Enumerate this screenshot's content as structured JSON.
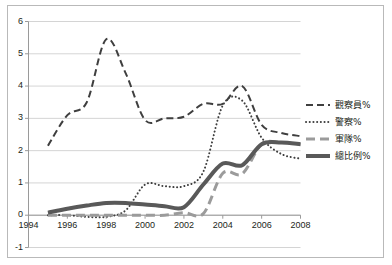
{
  "chart_data": {
    "type": "line",
    "title": "",
    "subtitle": "",
    "xlabel": "",
    "ylabel": "",
    "xlim": [
      1994,
      2008
    ],
    "ylim": [
      -1,
      6
    ],
    "yticks": [
      "6",
      "5",
      "4",
      "3",
      "2",
      "1",
      "0",
      "-1"
    ],
    "ytick_values": [
      6,
      5,
      4,
      3,
      2,
      1,
      0,
      -1
    ],
    "xticks": [
      "1994",
      "1996",
      "1998",
      "2000",
      "2002",
      "2004",
      "2006",
      "2008"
    ],
    "xtick_values": [
      1994,
      1996,
      1998,
      2000,
      2002,
      2004,
      2006,
      2008
    ],
    "grid": "horizontal",
    "legend_position": "right",
    "x": [
      1995,
      1996,
      1997,
      1998,
      1999,
      2000,
      2001,
      2002,
      2003,
      2004,
      2005,
      2006,
      2007,
      2008
    ],
    "series": [
      {
        "name": "觀察員%",
        "style": "dashed",
        "color": "#3f3f3f",
        "width": 2,
        "values": [
          2.15,
          3.1,
          3.5,
          5.45,
          4.4,
          2.95,
          3.0,
          3.05,
          3.45,
          3.45,
          4.0,
          2.8,
          2.55,
          2.45
        ]
      },
      {
        "name": "警察%",
        "style": "dotted",
        "color": "#3f3f3f",
        "width": 2,
        "values": [
          0.0,
          0.0,
          -0.05,
          -0.05,
          0.15,
          0.95,
          0.9,
          0.9,
          1.35,
          3.4,
          3.55,
          2.4,
          1.9,
          1.75
        ]
      },
      {
        "name": "軍隊%",
        "style": "dashed",
        "color": "#9b9b9b",
        "width": 3,
        "values": [
          0.0,
          0.0,
          0.0,
          0.0,
          0.0,
          0.0,
          0.0,
          0.08,
          0.05,
          1.3,
          1.28,
          2.2,
          2.25,
          2.2
        ]
      },
      {
        "name": "總比例%",
        "style": "solid",
        "color": "#595959",
        "width": 4,
        "values": [
          0.08,
          0.2,
          0.3,
          0.38,
          0.38,
          0.33,
          0.28,
          0.25,
          0.95,
          1.6,
          1.55,
          2.2,
          2.25,
          2.2
        ]
      }
    ]
  }
}
